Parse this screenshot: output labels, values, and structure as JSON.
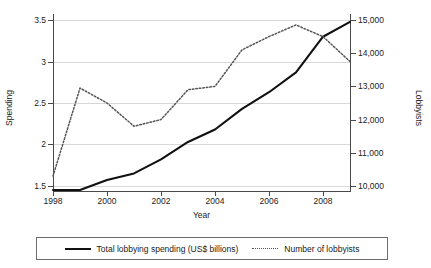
{
  "chart_data": {
    "type": "line",
    "title": "",
    "xlabel": "Year",
    "ylabel": "Spending",
    "ylabel_right": "Lobbyists",
    "grid": true,
    "legend_position": "bottom",
    "x": [
      1998,
      1999,
      2000,
      2001,
      2002,
      2003,
      2004,
      2005,
      2006,
      2007,
      2008,
      2009
    ],
    "xlim": [
      1998,
      2009
    ],
    "xticks": [
      "1998",
      "2000",
      "2002",
      "2004",
      "2006",
      "2008"
    ],
    "xtick_values": [
      1998,
      2000,
      2002,
      2004,
      2006,
      2008
    ],
    "ylim": [
      1.45,
      3.55
    ],
    "yticks": [
      "1.5",
      "2",
      "2.5",
      "3",
      "3.5"
    ],
    "ytick_values": [
      1.5,
      2,
      2.5,
      3,
      3.5
    ],
    "ylim_right": [
      9880,
      15120
    ],
    "yticks_right": [
      "10,000",
      "11,000",
      "12,000",
      "13,000",
      "14,000",
      "15,000"
    ],
    "ytick_values_right": [
      10000,
      11000,
      12000,
      13000,
      14000,
      15000
    ],
    "series": [
      {
        "name": "Total lobbying spending (US$ billions)",
        "axis": "left",
        "style": "solid",
        "color": "#111111",
        "values": [
          1.45,
          1.45,
          1.57,
          1.65,
          1.82,
          2.03,
          2.18,
          2.43,
          2.63,
          2.87,
          3.3,
          3.48
        ]
      },
      {
        "name": "Number of lobbyists",
        "axis": "right",
        "style": "dotted",
        "color": "#555555",
        "values": [
          10300,
          12950,
          12500,
          11800,
          12000,
          12900,
          13000,
          14100,
          14500,
          14850,
          14500,
          13750
        ]
      }
    ]
  },
  "legend": {
    "items": [
      {
        "label": "Total lobbying spending (US$ billions)",
        "style": "solid"
      },
      {
        "label": "Number of lobbyists",
        "style": "dotted"
      }
    ]
  }
}
